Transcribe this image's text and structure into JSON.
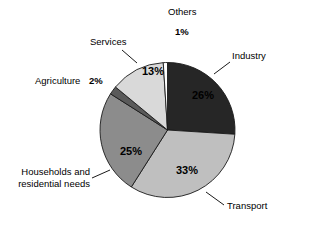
{
  "chart_data": {
    "type": "pie",
    "title": "",
    "subtitle": "",
    "xlabel": "",
    "ylabel": "",
    "legend_position": "none",
    "grid": false,
    "unit": "%",
    "categories": [
      "Industry",
      "Transport",
      "Households and residential needs",
      "Agriculture",
      "Services",
      "Others"
    ],
    "values": [
      26,
      33,
      25,
      2,
      13,
      1
    ],
    "slices": [
      {
        "name": "Industry",
        "label": "Industry",
        "value": 26,
        "value_label": "26%",
        "color": "#262626",
        "start_angle": 0,
        "end_angle": 93.6,
        "label_placement": "outside-right",
        "value_placement": "inside"
      },
      {
        "name": "Transport",
        "label": "Transport",
        "value": 33,
        "value_label": "33%",
        "color": "#bfbfbf",
        "start_angle": 93.6,
        "end_angle": 212.4,
        "label_placement": "outside-bottom-right",
        "value_placement": "inside"
      },
      {
        "name": "Households and residential needs",
        "label_line1": "Households and",
        "label_line2": "residential needs",
        "value": 25,
        "value_label": "25%",
        "color": "#8c8c8c",
        "start_angle": 212.4,
        "end_angle": 302.4,
        "label_placement": "outside-left",
        "value_placement": "inside"
      },
      {
        "name": "Agriculture",
        "label": "Agriculture",
        "value": 2,
        "value_label": "2%",
        "color": "#5a5a5a",
        "start_angle": 302.4,
        "end_angle": 309.6,
        "label_placement": "outside-left",
        "value_placement": "outside"
      },
      {
        "name": "Services",
        "label": "Services",
        "value": 13,
        "value_label": "13%",
        "color": "#d9d9d9",
        "start_angle": 309.6,
        "end_angle": 356.4,
        "label_placement": "outside-upper-left",
        "value_placement": "inside"
      },
      {
        "name": "Others",
        "label": "Others",
        "value": 1,
        "value_label": "1%",
        "color": "#ffffff",
        "start_angle": 356.4,
        "end_angle": 360,
        "label_placement": "outside-top",
        "value_placement": "outside"
      }
    ],
    "colors": {
      "industry": "#262626",
      "transport": "#bfbfbf",
      "households": "#8c8c8c",
      "agriculture": "#5a5a5a",
      "services": "#d9d9d9",
      "others": "#ffffff",
      "outline": "#1a1a1a",
      "background": "#ffffff",
      "text": "#000000"
    }
  },
  "labels": {
    "others": "Others",
    "others_pct": "1%",
    "industry": "Industry",
    "industry_pct": "26%",
    "transport": "Transport",
    "transport_pct": "33%",
    "households_line1": "Households and",
    "households_line2": "residential needs",
    "households_pct": "25%",
    "agriculture": "Agriculture",
    "agriculture_pct": "2%",
    "services": "Services",
    "services_pct": "13%"
  }
}
